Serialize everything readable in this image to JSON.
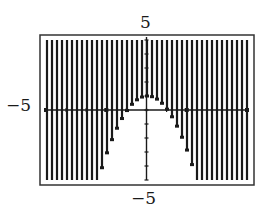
{
  "chart_data": {
    "type": "area",
    "title": "",
    "inequality": "y >= 1 - x^2",
    "boundary": {
      "function": "1 - x^2",
      "vertex": [
        0,
        1
      ],
      "x_intercepts": [
        -1,
        1
      ]
    },
    "shaded_region": "above",
    "window": {
      "xmin": -5,
      "xmax": 5,
      "ymin": -5,
      "ymax": 5,
      "xscl": 1,
      "yscl": 1
    },
    "xlim": [
      -5,
      5
    ],
    "ylim": [
      -5,
      5
    ],
    "tick_labels": {
      "top": "5",
      "bottom": "-5",
      "left": "-5"
    },
    "xlabel": "",
    "ylabel": "",
    "grid": false,
    "legend": null
  },
  "labels": {
    "ymax": "5",
    "ymin": "−5",
    "xmin": "−5"
  },
  "colors": {
    "ink": "#1a1a1a",
    "background": "#ffffff"
  }
}
